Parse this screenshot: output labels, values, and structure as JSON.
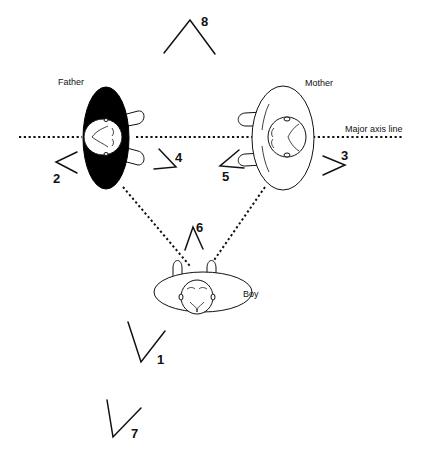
{
  "diagram": {
    "type": "seating arrangement / viewing angles (top view)",
    "labels": {
      "father": "Father",
      "mother": "Mother",
      "boy": "Boy",
      "axis": "Major axis line"
    },
    "figures": [
      {
        "name": "Father",
        "fill": "#000000",
        "facing": "left"
      },
      {
        "name": "Mother",
        "fill": "#ffffff",
        "facing": "right"
      },
      {
        "name": "Boy",
        "fill": "#ffffff",
        "facing": "down"
      }
    ],
    "angle_marks": [
      {
        "id": "1",
        "label": "1",
        "opening": "up"
      },
      {
        "id": "2",
        "label": "2",
        "opening": "right"
      },
      {
        "id": "3",
        "label": "3",
        "opening": "left"
      },
      {
        "id": "4",
        "label": "4",
        "opening": "up-left"
      },
      {
        "id": "5",
        "label": "5",
        "opening": "up-right"
      },
      {
        "id": "6",
        "label": "6",
        "opening": "down"
      },
      {
        "id": "7",
        "label": "7",
        "opening": "up"
      },
      {
        "id": "8",
        "label": "8",
        "opening": "down"
      }
    ],
    "colors": {
      "ink": "#111111",
      "background": "#ffffff",
      "father_body": "#000000"
    }
  }
}
